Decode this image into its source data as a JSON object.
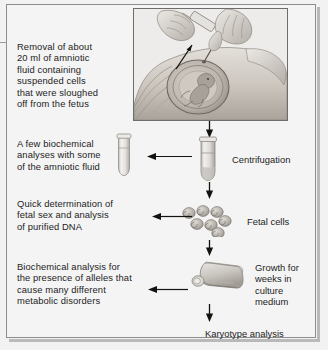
{
  "figure": {
    "background_color": "#f2f2f2",
    "frame_color": "#8c8c8c",
    "text_color": "#1d1d1d"
  },
  "steps": {
    "removal": "Removal of about\n20 ml of amniotic\nfluid containing\nsuspended cells\nthat were sloughed\noff from the fetus",
    "biochemical_few": "A few biochemical\nanalyses with some\nof the amniotic fluid",
    "centrifugation": "Centrifugation",
    "quick_determination": "Quick determination of\nfetal sex and analysis\nof purified DNA",
    "fetal_cells": "Fetal cells",
    "biochemical_alleles": "Biochemical analysis for\nthe presence of alleles that\ncause many different\nmetabolic disorders",
    "growth": "Growth for\nweeks in\nculture\nmedium",
    "karyotype": "Karyotype analysis"
  },
  "illustration": {
    "name": "amniocentesis-illustration",
    "elements": [
      "gloved-hand-holding-syringe-barrel",
      "gloved-hand-guiding-needle",
      "needle-inserted-into-abdomen",
      "pregnant-abdomen-profile",
      "amniotic-sac",
      "fetus",
      "indicator-arrow"
    ]
  },
  "objects": {
    "small_tube": "small-test-tube",
    "centrifuge_tube": "centrifuge-test-tube",
    "fetal_cell_count": 7,
    "culture_flask": "culture-flask"
  },
  "arrows": [
    {
      "name": "arrow-illustration-to-tube",
      "direction": "down"
    },
    {
      "name": "arrow-tube-to-small-tube",
      "direction": "left"
    },
    {
      "name": "arrow-tube-to-cells",
      "direction": "down"
    },
    {
      "name": "arrow-cells-to-dna",
      "direction": "left"
    },
    {
      "name": "arrow-cells-to-flask",
      "direction": "down"
    },
    {
      "name": "arrow-flask-to-biochemical",
      "direction": "left"
    },
    {
      "name": "arrow-flask-to-karyotype",
      "direction": "down"
    }
  ]
}
